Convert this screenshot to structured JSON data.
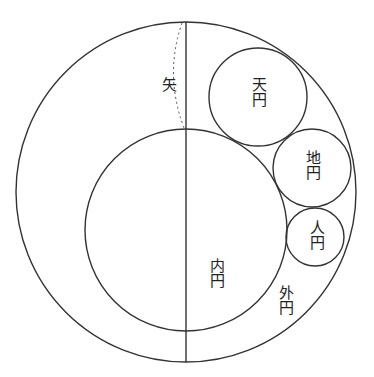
{
  "diagram": {
    "type": "geometric-circles",
    "stroke_color": "#333333",
    "background": "#ffffff",
    "circles": [
      {
        "name": "outer",
        "label": "外円",
        "cx": 186,
        "cy": 192,
        "r": 170
      },
      {
        "name": "inner",
        "label": "内円",
        "cx": 186,
        "cy": 230,
        "r": 101
      },
      {
        "name": "heaven",
        "label": "天円",
        "cx": 258,
        "cy": 97,
        "r": 49
      },
      {
        "name": "earth",
        "label": "地円",
        "cx": 312,
        "cy": 168,
        "r": 39
      },
      {
        "name": "human",
        "label": "人円",
        "cx": 315,
        "cy": 237,
        "r": 29
      }
    ],
    "chord": {
      "x": 186,
      "y1": 22,
      "y2": 362
    },
    "arrow_label": "矢",
    "labels": {
      "ya": "矢",
      "heaven": "天円",
      "earth": "地円",
      "human": "人円",
      "inner": "内円",
      "outer": "外円"
    }
  }
}
